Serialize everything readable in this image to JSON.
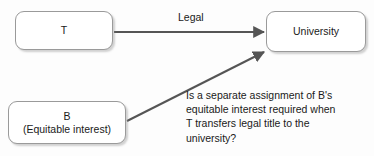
{
  "diagram": {
    "type": "flow-diagram",
    "background_color": "#fdfdfd",
    "node_border_color": "#9a9a9a",
    "edge_color": "#555555",
    "text_color": "#1a1a1a",
    "nodes": [
      {
        "id": "t",
        "lines": [
          "T"
        ]
      },
      {
        "id": "university",
        "lines": [
          "University"
        ]
      },
      {
        "id": "b",
        "line1": "B",
        "line2": "(Equitable interest)"
      }
    ],
    "edges": [
      {
        "id": "t-to-university",
        "label": "Legal",
        "from": "t",
        "to": "university",
        "arrowhead": "end"
      },
      {
        "id": "b-to-university",
        "label": "",
        "from": "b",
        "to": "university",
        "arrowhead": "end"
      }
    ],
    "question": {
      "line1": "Is a separate assignment of B's",
      "line2": "equitable interest required when",
      "line3": "T transfers legal title to the",
      "line4": "university?"
    }
  }
}
